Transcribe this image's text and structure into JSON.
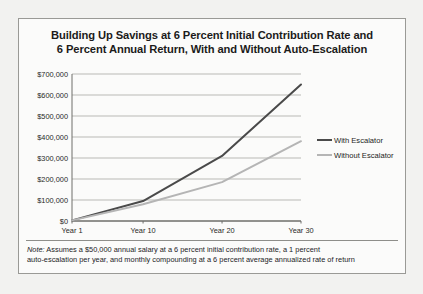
{
  "figure": {
    "title_line_1": "Building Up Savings at 6 Percent Initial Contribution Rate and",
    "title_line_2": "6 Percent Annual Return, With and Without Auto-Escalation",
    "note_lead": "Note:",
    "note_line_1": " Assumes a $50,000 annual salary at a 6 percent initial contribution rate, a 1 percent",
    "note_line_2": "auto-escalation per year, and monthly compounding at a 6 percent average annualized rate of return"
  },
  "colors": {
    "series_with_escalator": "#4a4a4a",
    "series_without_escalator": "#b5b5b5",
    "gridline": "#b9b9b5",
    "axis": "#6e6e6a",
    "page_background": "#f2f2f0",
    "panel_background": "#fbfbfa",
    "panel_border": "#9a9a96",
    "text": "#1b1b1b"
  },
  "chart_data": {
    "type": "line",
    "title": "Building Up Savings at 6 Percent Initial Contribution Rate and 6 Percent Annual Return, With and Without Auto-Escalation",
    "xlabel": "",
    "ylabel": "",
    "x": [
      1,
      10,
      20,
      30
    ],
    "categories": [
      "Year 1",
      "Year 10",
      "Year 20",
      "Year 30"
    ],
    "xtick_labels": [
      "Year 1",
      "Year 10",
      "Year 20",
      "Year 30"
    ],
    "ytick_labels": [
      "$0",
      "$100,000",
      "$200,000",
      "$300,000",
      "$400,000",
      "$500,000",
      "$600,000",
      "$700,000"
    ],
    "ytick_values": [
      0,
      100000,
      200000,
      300000,
      400000,
      500000,
      600000,
      700000
    ],
    "ylim": [
      0,
      700000
    ],
    "xlim": [
      1,
      30
    ],
    "grid": "horizontal",
    "legend_position": "right",
    "series": [
      {
        "name": "With Escalator",
        "color": "#4a4a4a",
        "values": [
          3000,
          95000,
          310000,
          650000
        ]
      },
      {
        "name": "Without Escalator",
        "color": "#b5b5b5",
        "values": [
          3000,
          80000,
          185000,
          380000
        ]
      }
    ]
  }
}
